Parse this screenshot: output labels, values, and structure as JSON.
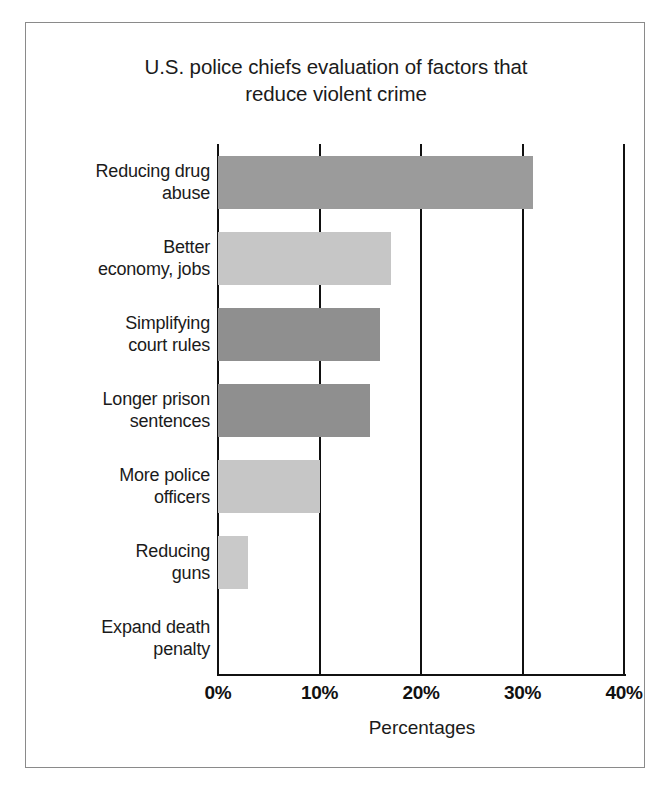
{
  "figure": {
    "frame_color": "#8a8a8a",
    "background": "#ffffff"
  },
  "chart_data": {
    "type": "bar",
    "orientation": "horizontal",
    "title": "U.S. police chiefs evaluation of factors that\nreduce violent crime",
    "xlabel": "Percentages",
    "ylabel": "",
    "categories": [
      "Reducing drug\nabuse",
      "Better\neconomy, jobs",
      "Simplifying\ncourt rules",
      "Longer prison\nsentences",
      "More police\nofficers",
      "Reducing\nguns",
      "Expand death\npenalty"
    ],
    "values": [
      31,
      17,
      16,
      15,
      10,
      3,
      0
    ],
    "value_unit": "%",
    "xlim": [
      0,
      40
    ],
    "xticks": [
      0,
      10,
      20,
      30,
      40
    ],
    "xtick_labels": [
      "0%",
      "10%",
      "20%",
      "30%",
      "40%"
    ],
    "grid": "vertical",
    "legend": "none",
    "bar_colors": [
      "#9b9b9b",
      "#c6c6c6",
      "#8f8f8f",
      "#8f8f8f",
      "#c6c6c6",
      "#c9c9c9",
      "#c9c9c9"
    ],
    "axis_color": "#111111"
  }
}
